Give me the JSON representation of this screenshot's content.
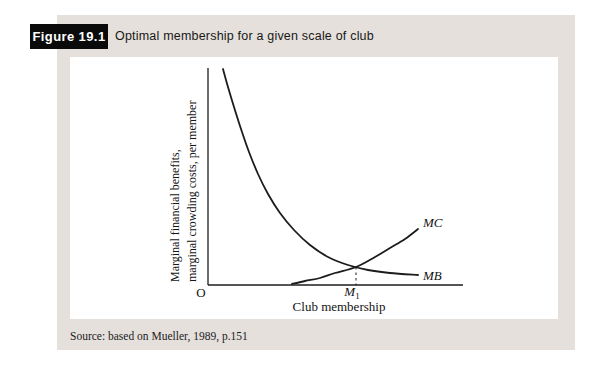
{
  "header": {
    "figure_label": "Figure 19.1",
    "title": "Optimal membership for a given scale of club"
  },
  "source": "Source: based on Mueller, 1989, p.151",
  "colors": {
    "panel_bg": "#e5e0db",
    "figure_box_bg": "#0a0a0a",
    "figure_box_text": "#ffffff",
    "curve": "#1c1c1c",
    "chart_bg": "#ffffff"
  },
  "chart_data": {
    "type": "line",
    "title": "Optimal membership for a given scale of club",
    "xlabel": "Club membership",
    "ylabel_line1": "Marginal financial benefits,",
    "ylabel_line2": "marginal crowding costs, per member",
    "origin_label": "O",
    "x_axis_marker": {
      "base": "M",
      "sub": "1"
    },
    "axes": {
      "numeric_scale": false,
      "grid": false
    },
    "series": [
      {
        "name": "MB",
        "label": "MB",
        "points": [
          [
            153,
            12
          ],
          [
            158,
            30
          ],
          [
            164,
            50
          ],
          [
            171,
            72
          ],
          [
            179,
            95
          ],
          [
            188,
            117
          ],
          [
            198,
            137
          ],
          [
            210,
            156
          ],
          [
            224,
            173
          ],
          [
            240,
            188
          ],
          [
            258,
            200
          ],
          [
            278,
            208
          ],
          [
            298,
            213
          ],
          [
            320,
            216
          ],
          [
            348,
            218
          ]
        ]
      },
      {
        "name": "MC",
        "label": "MC",
        "points": [
          [
            222,
            227
          ],
          [
            235,
            224
          ],
          [
            250,
            221
          ],
          [
            265,
            216
          ],
          [
            286,
            210
          ],
          [
            305,
            200
          ],
          [
            320,
            191
          ],
          [
            335,
            182
          ],
          [
            348,
            172
          ]
        ]
      }
    ],
    "intersection": {
      "x": 286,
      "y": 210,
      "x_axis_y": 228
    }
  }
}
